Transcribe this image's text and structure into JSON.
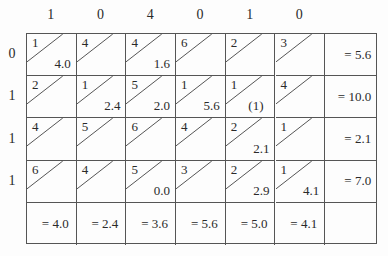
{
  "column_headers": [
    "1",
    "0",
    "4",
    "0",
    "1",
    "0"
  ],
  "row_labels": [
    "0",
    "1",
    "1",
    "1"
  ],
  "rows": [
    {
      "cells": [
        {
          "cost": "1",
          "value": "4.0"
        },
        {
          "cost": "4",
          "value": ""
        },
        {
          "cost": "4",
          "value": "1.6"
        },
        {
          "cost": "6",
          "value": ""
        },
        {
          "cost": "2",
          "value": ""
        },
        {
          "cost": "3",
          "value": ""
        }
      ],
      "sum": "= 5.6"
    },
    {
      "cells": [
        {
          "cost": "2",
          "value": ""
        },
        {
          "cost": "1",
          "value": "2.4"
        },
        {
          "cost": "5",
          "value": "2.0"
        },
        {
          "cost": "1",
          "value": "5.6"
        },
        {
          "cost": "1",
          "value": "(1)"
        },
        {
          "cost": "4",
          "value": ""
        }
      ],
      "sum": "= 10.0"
    },
    {
      "cells": [
        {
          "cost": "4",
          "value": ""
        },
        {
          "cost": "5",
          "value": ""
        },
        {
          "cost": "6",
          "value": ""
        },
        {
          "cost": "4",
          "value": ""
        },
        {
          "cost": "2",
          "value": "2.1"
        },
        {
          "cost": "1",
          "value": ""
        }
      ],
      "sum": "= 2.1"
    },
    {
      "cells": [
        {
          "cost": "6",
          "value": ""
        },
        {
          "cost": "4",
          "value": ""
        },
        {
          "cost": "5",
          "value": "0.0"
        },
        {
          "cost": "3",
          "value": ""
        },
        {
          "cost": "2",
          "value": "2.9"
        },
        {
          "cost": "1",
          "value": "4.1"
        }
      ],
      "sum": "= 7.0"
    }
  ],
  "column_sums": [
    "= 4.0",
    "= 2.4",
    "= 3.6",
    "= 5.6",
    "= 5.0",
    "= 4.1"
  ],
  "colors": {
    "line": "#555555",
    "text": "#2a2a2a",
    "background": "#fdfdfd"
  }
}
